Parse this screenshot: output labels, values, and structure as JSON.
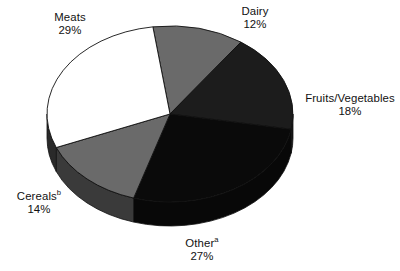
{
  "chart_data": {
    "type": "pie",
    "title": "",
    "subtitle": "",
    "xlabel": "",
    "ylabel": "",
    "legend_position": "none",
    "grid": false,
    "three_d": true,
    "start_angle_deg": 352,
    "direction": "clockwise",
    "categories": [
      "Dairy",
      "Fruits/Vegetables",
      "Other",
      "Cereals",
      "Meats"
    ],
    "values": [
      12,
      18,
      27,
      14,
      29
    ],
    "value_suffix": "%",
    "slices": [
      {
        "name": "Dairy",
        "label": "Dairy",
        "value": 12,
        "value_text": "12%",
        "superscript": "",
        "color": "#6a6a6a",
        "side_color": "#4a4a4a",
        "exploded": false,
        "outlined": false
      },
      {
        "name": "Fruits/Vegetables",
        "label": "Fruits/Vegetables",
        "value": 18,
        "value_text": "18%",
        "superscript": "",
        "color": "#1c1c1c",
        "side_color": "#151515",
        "exploded": false,
        "outlined": false
      },
      {
        "name": "Other",
        "label": "Other",
        "value": 27,
        "value_text": "27%",
        "superscript": "a",
        "color": "#0a0a0a",
        "side_color": "#080808",
        "exploded": false,
        "outlined": true
      },
      {
        "name": "Cereals",
        "label": "Cereals",
        "value": 14,
        "value_text": "14%",
        "superscript": "b",
        "color": "#6a6a6a",
        "side_color": "#3a3a3a",
        "exploded": false,
        "outlined": false
      },
      {
        "name": "Meats",
        "label": "Meats",
        "value": 29,
        "value_text": "29%",
        "superscript": "",
        "color": "#ffffff",
        "side_color": "#2a2a2a",
        "exploded": false,
        "outlined": false
      }
    ],
    "footnote_markers": [
      "a",
      "b"
    ],
    "outline_color": "#ffffff",
    "stroke_color": "#111111",
    "background": "#ffffff"
  }
}
